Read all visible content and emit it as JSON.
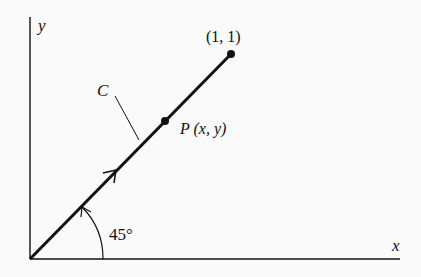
{
  "diagram": {
    "axes": {
      "x_label": "x",
      "y_label": "y"
    },
    "curve_label": "C",
    "endpoint_label": "(1, 1)",
    "point_label": "P (x, y)",
    "angle_label": "45°",
    "colors": {
      "ink": "#111111",
      "background": "#fafafa"
    }
  }
}
